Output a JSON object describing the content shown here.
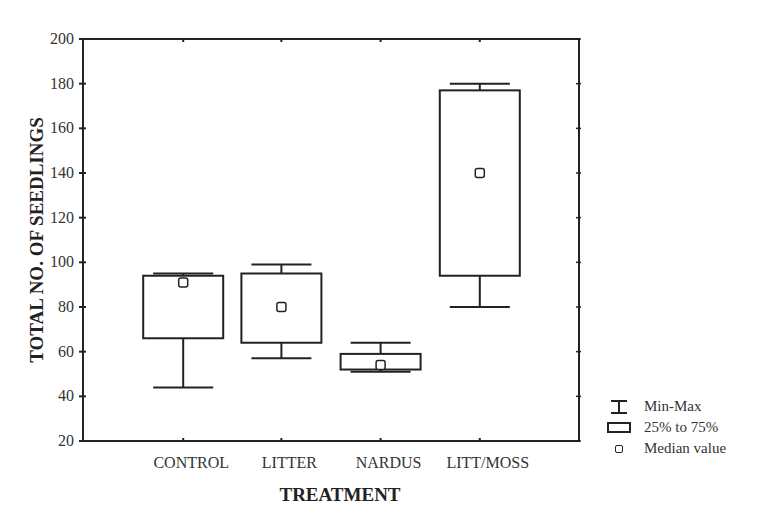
{
  "chart_data": {
    "type": "box",
    "title": "",
    "xlabel": "TREATMENT",
    "ylabel": "TOTAL NO. OF SEEDLINGS",
    "ylim": [
      20,
      200
    ],
    "yticks": [
      20,
      40,
      60,
      80,
      100,
      120,
      140,
      160,
      180,
      200
    ],
    "grid": false,
    "categories": [
      "CONTROL",
      "LITTER",
      "NARDUS",
      "LITT/MOSS"
    ],
    "series": [
      {
        "name": "CONTROL",
        "min": 44,
        "q1": 66,
        "median": 91,
        "q3": 94,
        "max": 95
      },
      {
        "name": "LITTER",
        "min": 57,
        "q1": 64,
        "median": 80,
        "q3": 95,
        "max": 99
      },
      {
        "name": "NARDUS",
        "min": 51,
        "q1": 52,
        "median": 54,
        "q3": 59,
        "max": 64
      },
      {
        "name": "LITT/MOSS",
        "min": 80,
        "q1": 94,
        "median": 140,
        "q3": 177,
        "max": 180
      }
    ],
    "legend": {
      "position": "bottom-right",
      "entries": [
        {
          "symbol": "min-max-whisker",
          "label": "Min-Max"
        },
        {
          "symbol": "box",
          "label": "25% to 75%"
        },
        {
          "symbol": "median-square",
          "label": "Median value"
        }
      ]
    }
  },
  "legend": {
    "minmax_label": "Min-Max",
    "box_label": "25% to 75%",
    "median_label": "Median value"
  },
  "axes": {
    "xlabel": "TREATMENT",
    "ylabel": "TOTAL NO. OF SEEDLINGS"
  },
  "colors": {
    "ink": "#222222",
    "background": "#ffffff"
  }
}
